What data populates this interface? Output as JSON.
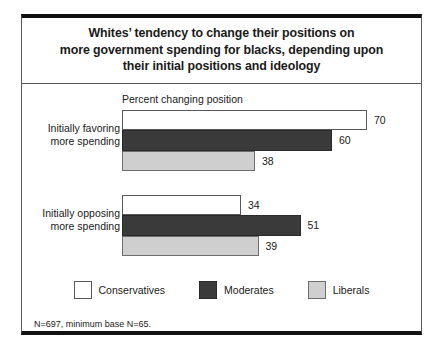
{
  "figure": {
    "title_lines": [
      "Whites’ tendency to change their positions on",
      "more government spending for blacks, depending upon",
      "their initial positions and ideology"
    ],
    "axis_caption": "Percent changing position",
    "footnote": "N=697, minimum base N=65."
  },
  "chart_data": {
    "type": "bar",
    "orientation": "horizontal",
    "title": "Whites’ tendency to change their positions on more government spending for blacks, depending upon their initial positions and ideology",
    "xlabel": "Percent changing position",
    "ylabel": "",
    "xlim": [
      0,
      70
    ],
    "grid": false,
    "legend_position": "bottom",
    "categories": [
      "Initially favoring more spending",
      "Initially opposing more spending"
    ],
    "category_lines": [
      [
        "Initially favoring",
        "more spending"
      ],
      [
        "Initially opposing",
        "more spending"
      ]
    ],
    "series": [
      {
        "name": "Conservatives",
        "color": "#ffffff",
        "values": [
          70,
          34
        ]
      },
      {
        "name": "Moderates",
        "color": "#3a3a3a",
        "values": [
          60,
          51
        ]
      },
      {
        "name": "Liberals",
        "color": "#cfcfcf",
        "values": [
          38,
          39
        ]
      }
    ],
    "annotation": "N=697, minimum base N=65."
  },
  "legend": {
    "items": [
      {
        "label": "Conservatives",
        "key": "conservatives"
      },
      {
        "label": "Moderates",
        "key": "moderates"
      },
      {
        "label": "Liberals",
        "key": "liberals"
      }
    ]
  }
}
